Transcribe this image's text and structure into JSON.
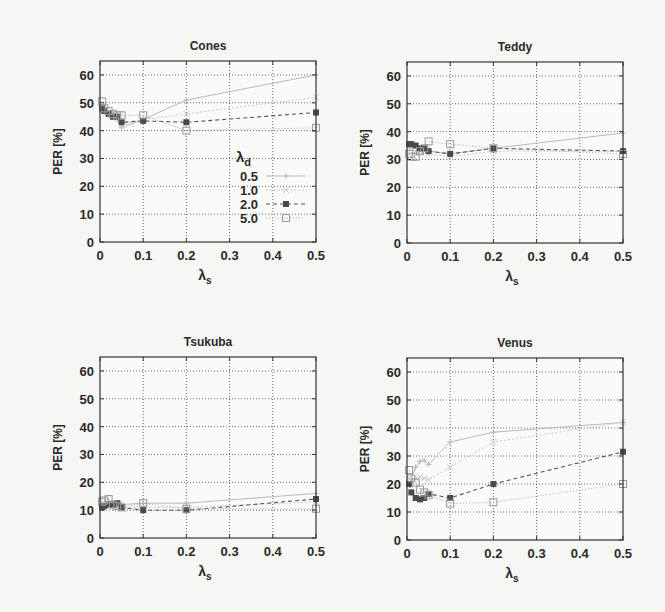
{
  "figure": {
    "ylabel": "PER [%]",
    "xlabel_main": "λ",
    "xlabel_sub": "s",
    "legend_title_main": "λ",
    "legend_title_sub": "d"
  },
  "chart_data": [
    {
      "type": "line",
      "title": "Cones",
      "xlabel": "λs",
      "ylabel": "PER [%]",
      "xlim": [
        0,
        0.5
      ],
      "ylim": [
        0,
        65
      ],
      "xticks": [
        "0",
        "0.1",
        "0.2",
        "0.3",
        "0.4",
        "0.5"
      ],
      "yticks": [
        "0",
        "10",
        "20",
        "30",
        "40",
        "50",
        "60"
      ],
      "grid": true,
      "legend": {
        "title": "λd",
        "position": "inside-right",
        "entries": [
          "0.5",
          "1.0",
          "2.0",
          "5.0"
        ]
      },
      "x": [
        0.005,
        0.01,
        0.02,
        0.03,
        0.04,
        0.05,
        0.1,
        0.2,
        0.5
      ],
      "series": [
        {
          "name": "0.5",
          "values": [
            48,
            47,
            46,
            45,
            44,
            41,
            44,
            51,
            60
          ]
        },
        {
          "name": "1.0",
          "values": [
            49,
            47.5,
            46.5,
            45.5,
            44.5,
            42,
            44,
            46,
            52
          ]
        },
        {
          "name": "2.0",
          "values": [
            48,
            47,
            46,
            45,
            45,
            43,
            43.5,
            43,
            46.5
          ]
        },
        {
          "name": "5.0",
          "values": [
            50.5,
            48,
            47,
            46,
            45.5,
            45.5,
            45.5,
            40,
            41
          ]
        }
      ]
    },
    {
      "type": "line",
      "title": "Teddy",
      "xlabel": "λs",
      "ylabel": "PER [%]",
      "xlim": [
        0,
        0.5
      ],
      "ylim": [
        0,
        65
      ],
      "xticks": [
        "0",
        "0.1",
        "0.2",
        "0.3",
        "0.4",
        "0.5"
      ],
      "yticks": [
        "0",
        "10",
        "20",
        "30",
        "40",
        "50",
        "60"
      ],
      "grid": true,
      "x": [
        0.005,
        0.01,
        0.02,
        0.03,
        0.04,
        0.05,
        0.1,
        0.2,
        0.5
      ],
      "series": [
        {
          "name": "0.5",
          "values": [
            35,
            35,
            35,
            34,
            34,
            33,
            32,
            34,
            39.5
          ]
        },
        {
          "name": "1.0",
          "values": [
            34,
            34,
            33,
            33,
            33,
            32,
            31,
            33,
            33
          ]
        },
        {
          "name": "2.0",
          "values": [
            35.5,
            35.5,
            35,
            34,
            34,
            33,
            32,
            34,
            33
          ]
        },
        {
          "name": "5.0",
          "values": [
            32,
            31,
            31,
            33,
            34,
            36.5,
            35.5,
            34,
            32
          ]
        }
      ]
    },
    {
      "type": "line",
      "title": "Tsukuba",
      "xlabel": "λs",
      "ylabel": "PER [%]",
      "xlim": [
        0,
        0.5
      ],
      "ylim": [
        0,
        65
      ],
      "xticks": [
        "0",
        "0.1",
        "0.2",
        "0.3",
        "0.4",
        "0.5"
      ],
      "yticks": [
        "0",
        "10",
        "20",
        "30",
        "40",
        "50",
        "60"
      ],
      "grid": true,
      "x": [
        0.005,
        0.01,
        0.02,
        0.03,
        0.04,
        0.05,
        0.1,
        0.2,
        0.5
      ],
      "series": [
        {
          "name": "0.5",
          "values": [
            12,
            12.5,
            13,
            12.5,
            12.5,
            12,
            12.5,
            12.5,
            16
          ]
        },
        {
          "name": "1.0",
          "values": [
            11.5,
            12,
            12,
            12,
            11.5,
            11,
            11,
            11,
            13
          ]
        },
        {
          "name": "2.0",
          "values": [
            11,
            11.5,
            12,
            12,
            12.5,
            11,
            10,
            10,
            14
          ]
        },
        {
          "name": "5.0",
          "values": [
            13,
            13.5,
            14,
            12,
            11.5,
            11,
            12.5,
            10.5,
            10.5
          ]
        }
      ]
    },
    {
      "type": "line",
      "title": "Venus",
      "xlabel": "λs",
      "ylabel": "PER [%]",
      "xlim": [
        0,
        0.5
      ],
      "ylim": [
        0,
        65
      ],
      "xticks": [
        "0",
        "0.1",
        "0.2",
        "0.3",
        "0.4",
        "0.5"
      ],
      "yticks": [
        "0",
        "10",
        "20",
        "30",
        "40",
        "50",
        "60"
      ],
      "grid": true,
      "x": [
        0.005,
        0.01,
        0.02,
        0.03,
        0.04,
        0.05,
        0.1,
        0.2,
        0.5
      ],
      "series": [
        {
          "name": "0.5",
          "values": [
            20,
            22,
            26,
            28,
            28.5,
            27,
            35,
            38.5,
            42
          ]
        },
        {
          "name": "1.0",
          "values": [
            20,
            21,
            22,
            22.5,
            22,
            21.5,
            26,
            35,
            42
          ]
        },
        {
          "name": "2.0",
          "values": [
            20,
            17,
            15,
            14.5,
            15,
            16.5,
            15,
            20,
            31.5
          ]
        },
        {
          "name": "5.0",
          "values": [
            25,
            22,
            20.5,
            18,
            17,
            16,
            13,
            13.5,
            20
          ]
        }
      ]
    }
  ],
  "styles": {
    "series_colors": [
      "#b9b9b9",
      "#c8c8c8",
      "#555555",
      "#a8a8a8"
    ],
    "series_markers": [
      "plus",
      "cross",
      "star",
      "square"
    ],
    "series_dash": [
      "",
      "2,2",
      "4,3",
      "1,2"
    ]
  }
}
